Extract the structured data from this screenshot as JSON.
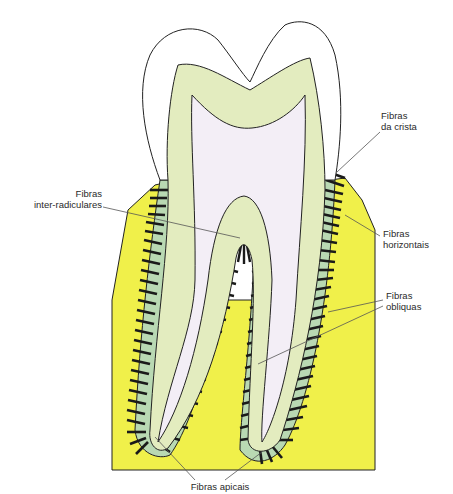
{
  "figure": {
    "colors": {
      "bone": "#f0f04a",
      "enamel": "#ffffff",
      "dentin": "#e3ecbf",
      "pulp": "#f3eef6",
      "ligament": "#b9d9b3",
      "fiber": "#1a1a1a",
      "outline": "#222222",
      "leader": "#555555"
    }
  },
  "labels": {
    "crista": {
      "line1": "Fibras",
      "line2": "da crista"
    },
    "inter": {
      "line1": "Fibras",
      "line2": "inter-radiculares"
    },
    "horizontais": {
      "line1": "Fibras",
      "line2": "horizontais"
    },
    "obliquas": {
      "line1": "Fibras",
      "line2": "obliquas"
    },
    "apicais": {
      "line1": "Fibras apicais"
    }
  }
}
